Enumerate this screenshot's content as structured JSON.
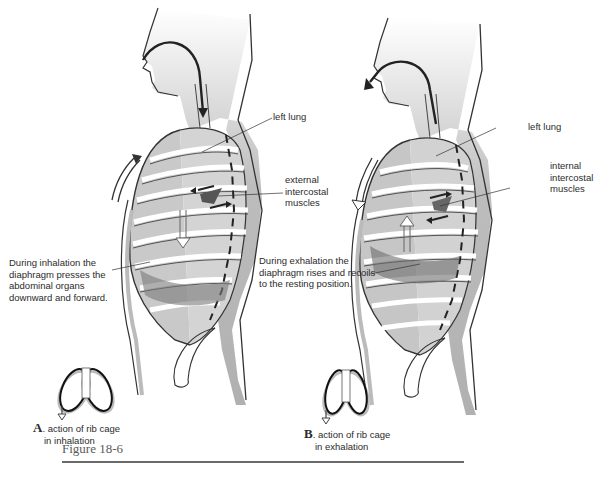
{
  "figure": {
    "title": "Figure 18-6",
    "panel_a": {
      "letter": "A",
      "caption_line1": ". action of rib cage",
      "caption_line2": "in inhalation",
      "labels": {
        "lung": "left lung",
        "muscles_line1": "external",
        "muscles_line2": "intercostal",
        "muscles_line3": "muscles",
        "diaphragm_line1": "During inhalation the",
        "diaphragm_line2": "diaphragm presses the",
        "diaphragm_line3": "abdominal organs",
        "diaphragm_line4": "downward and forward."
      }
    },
    "panel_b": {
      "letter": "B",
      "caption_line1": ". action of rib cage",
      "caption_line2": "in exhalation",
      "labels": {
        "lung": "left lung",
        "muscles_line1": "internal",
        "muscles_line2": "intercostal",
        "muscles_line3": "muscles",
        "diaphragm_line1": "During exhalation the",
        "diaphragm_line2": "diaphragm rises and recoils",
        "diaphragm_line3": "to the resting position."
      }
    }
  }
}
